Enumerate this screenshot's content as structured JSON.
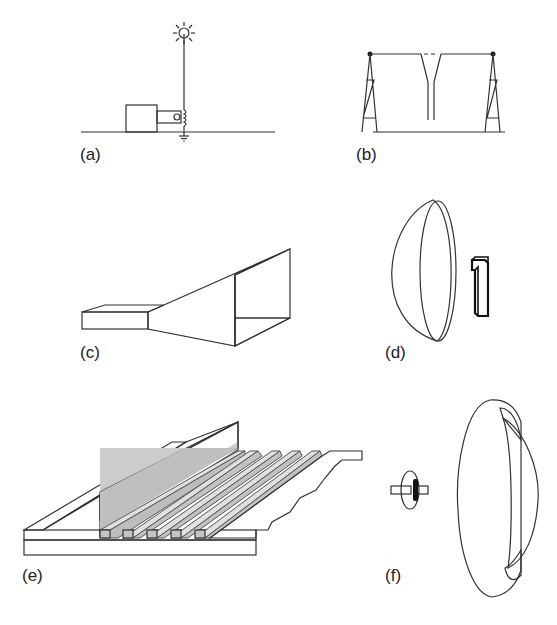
{
  "figure": {
    "panels": [
      {
        "id": "a",
        "label": "(a)",
        "description": "monopole wire antenna over ground with transmitter box, coupling coil and ground symbol"
      },
      {
        "id": "b",
        "label": "(b)",
        "description": "horizontal wire antenna between two lattice towers with Y-shaped feed line"
      },
      {
        "id": "c",
        "label": "(c)",
        "description": "pyramidal horn antenna fed by rectangular waveguide"
      },
      {
        "id": "d",
        "label": "(d)",
        "description": "parabolic reflector dish with feed element"
      },
      {
        "id": "e",
        "label": "(e)",
        "description": "corrugated / slotted surface antenna on ground plane"
      },
      {
        "id": "f",
        "label": "(f)",
        "description": "dielectric lens antenna with dipole feed"
      }
    ]
  },
  "colors": {
    "line": "#333333",
    "fill_light": "#e4e4e4",
    "fill_mid": "#cfcfcf",
    "fill_dark": "#b9b9b9",
    "background": "#ffffff"
  }
}
